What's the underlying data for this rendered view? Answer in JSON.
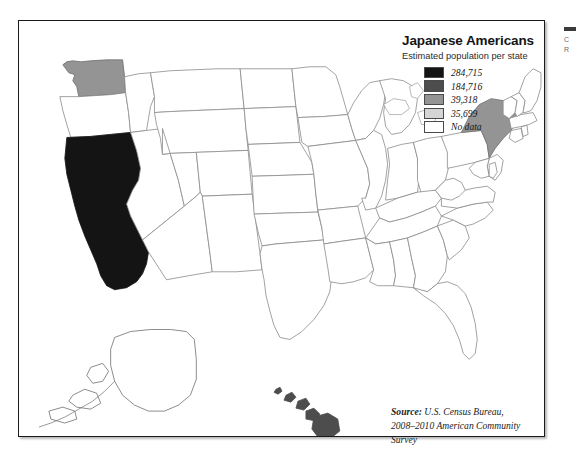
{
  "map": {
    "title": "Japanese Americans",
    "subtitle": "Estimated population per state",
    "legend": {
      "entries": [
        {
          "label": "284,715",
          "color": "#141414",
          "tier": "highest"
        },
        {
          "label": "184,716",
          "color": "#4d4d4d",
          "tier": "high"
        },
        {
          "label": "39,318",
          "color": "#949494",
          "tier": "medium"
        },
        {
          "label": "35,699",
          "color": "#d5d5d5",
          "tier": "low"
        },
        {
          "label": "No data",
          "color": "#ffffff",
          "tier": "none"
        }
      ]
    },
    "source": {
      "lead": "Source:",
      "line1_rest": " U.S. Census Bureau,",
      "line2": "2008–2010 American Community Survey"
    },
    "colors": {
      "state_outline": "#8a8a8a",
      "coast_outline": "#6e6e6e",
      "frame": "#1a1a1a",
      "background": "#ffffff"
    },
    "states": [
      {
        "code": "CA",
        "name": "California",
        "value": "284,715",
        "fill": "#141414"
      },
      {
        "code": "HI",
        "name": "Hawaii",
        "value": "184,716",
        "fill": "#4d4d4d"
      },
      {
        "code": "WA",
        "name": "Washington",
        "value": "39,318",
        "fill": "#949494"
      },
      {
        "code": "NY",
        "name": "New York",
        "value": "39,318",
        "fill": "#949494"
      },
      {
        "code": "AK",
        "name": "Alaska",
        "value": "No data",
        "fill": "#ffffff"
      }
    ]
  },
  "right_panel": {
    "line1": "C",
    "line2": "R"
  }
}
